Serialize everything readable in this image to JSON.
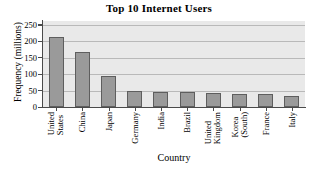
{
  "chart_data": {
    "type": "bar",
    "title": "Top 10 Internet Users",
    "xlabel": "Country",
    "ylabel": "Frequency (millions)",
    "categories": [
      "United States",
      "China",
      "Japan",
      "Germany",
      "India",
      "Brazil",
      "United Kingdom",
      "Korea (South)",
      "France",
      "Italy"
    ],
    "category_lines": [
      [
        "United",
        "States"
      ],
      [
        "China"
      ],
      [
        "Japan"
      ],
      [
        "Germany"
      ],
      [
        "India"
      ],
      [
        "Brazil"
      ],
      [
        "United",
        "Kingdom"
      ],
      [
        "Korea",
        "(South)"
      ],
      [
        "France"
      ],
      [
        "Italy"
      ]
    ],
    "values": [
      213,
      167,
      94,
      49,
      45,
      45,
      42,
      39,
      39,
      35
    ],
    "ylim": [
      0,
      262
    ],
    "yticks": [
      0,
      50,
      100,
      150,
      200,
      250
    ],
    "ytick_labels": [
      "0",
      "50",
      "100",
      "150",
      "200",
      "250"
    ],
    "grid": true,
    "legend": false,
    "colors": {
      "bar_fill": "#9a9a9a",
      "bar_edge": "#5e5e5e",
      "plot_background": "#e9e9e9",
      "gridline": "#b9b9b9",
      "axis": "#4a4a4a",
      "text": "#000000",
      "figure_background": "#ffffff"
    }
  }
}
